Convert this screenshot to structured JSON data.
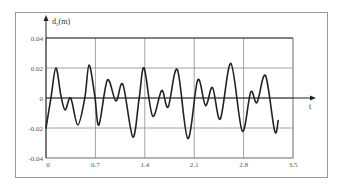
{
  "chart_data": {
    "type": "line",
    "title": "",
    "xlabel": "t",
    "ylabel": "d",
    "ylabel_subscript": "2",
    "ylabel_unit": "(m)",
    "xlim": [
      0,
      3.5
    ],
    "ylim": [
      -0.04,
      0.04
    ],
    "grid": true,
    "legend": null,
    "x_ticks": [
      0,
      0.7,
      1.4,
      2.1,
      2.8,
      3.5
    ],
    "x_tick_labels": [
      "0",
      "0.7",
      "1.4",
      "2.1",
      "2.8",
      "3.5"
    ],
    "y_ticks": [
      0.04,
      0.02,
      0,
      -0.02,
      -0.04
    ],
    "y_tick_labels": [
      "0.04",
      "0.02",
      "0",
      "-0.02",
      "-0.04"
    ],
    "series": [
      {
        "name": "d2",
        "color": "#222222",
        "points": [
          [
            0.0,
            -0.02
          ],
          [
            0.07,
            0.0
          ],
          [
            0.14,
            0.02
          ],
          [
            0.21,
            0.002
          ],
          [
            0.27,
            -0.008
          ],
          [
            0.35,
            0.0
          ],
          [
            0.45,
            -0.018
          ],
          [
            0.55,
            0.0
          ],
          [
            0.61,
            0.022
          ],
          [
            0.69,
            0.002
          ],
          [
            0.75,
            -0.018
          ],
          [
            0.87,
            0.012
          ],
          [
            0.99,
            -0.002
          ],
          [
            1.09,
            0.009
          ],
          [
            1.23,
            -0.026
          ],
          [
            1.32,
            0.0
          ],
          [
            1.39,
            0.02
          ],
          [
            1.51,
            -0.012
          ],
          [
            1.64,
            0.005
          ],
          [
            1.73,
            -0.006
          ],
          [
            1.86,
            0.019
          ],
          [
            2.01,
            -0.027
          ],
          [
            2.15,
            0.012
          ],
          [
            2.26,
            -0.005
          ],
          [
            2.36,
            0.007
          ],
          [
            2.47,
            -0.014
          ],
          [
            2.62,
            0.023
          ],
          [
            2.78,
            -0.022
          ],
          [
            2.9,
            0.004
          ],
          [
            2.99,
            -0.003
          ],
          [
            3.11,
            0.015
          ],
          [
            3.24,
            -0.022
          ],
          [
            3.29,
            -0.015
          ]
        ]
      }
    ]
  },
  "labels": {
    "y_axis_symbol": "d",
    "y_axis_subscript": "2",
    "y_axis_unit": "(m)",
    "x_axis": "t"
  },
  "colors": {
    "line": "#222222",
    "grid": "#8a8a8a",
    "axis": "#222222",
    "frame": "#9a9a9a",
    "text": "#555555"
  }
}
